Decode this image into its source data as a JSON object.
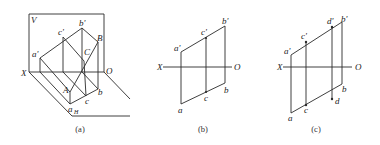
{
  "figure": {
    "panels": [
      {
        "id": "a",
        "caption": "(a)",
        "labels": {
          "V": "V",
          "X": "X",
          "O": "O",
          "a_prime": "a'",
          "c_prime": "c'",
          "b_prime": "b'",
          "B": "B",
          "C": "C",
          "A": "A",
          "a_H": "a",
          "a_H_sub": "H",
          "c": "c",
          "b": "b"
        }
      },
      {
        "id": "b",
        "caption": "(b)",
        "labels": {
          "X": "X",
          "O": "O",
          "a_prime": "a'",
          "c_prime": "c'",
          "b_prime": "b'",
          "a": "a",
          "c": "c",
          "b": "b"
        }
      },
      {
        "id": "c",
        "caption": "(c)",
        "labels": {
          "X": "X",
          "O": "O",
          "a_prime": "a'",
          "c_prime": "c'",
          "d_prime": "d'",
          "b_prime": "b'",
          "a": "a",
          "c": "c",
          "d": "d",
          "b": "b"
        }
      }
    ]
  }
}
